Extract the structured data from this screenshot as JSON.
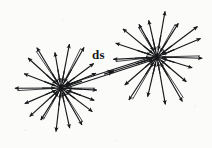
{
  "figure": {
    "title": "ds",
    "background_color": "#fbfbfa",
    "ink_color": "#17181a",
    "width": 212,
    "height": 148
  },
  "labels": [
    {
      "id": "ds",
      "text": "ds",
      "x": 92,
      "y": 48
    }
  ],
  "chart_data": {
    "type": "scatter",
    "title": "ds",
    "xlabel": "",
    "ylabel": "",
    "xlim": [
      0,
      212
    ],
    "ylim": [
      0,
      148
    ],
    "grid": false,
    "legend": "none",
    "annotations": [
      {
        "text": "ds",
        "x": 92,
        "y": 48
      }
    ],
    "sources": [
      {
        "name": "left-source",
        "cx": 61,
        "cy": 88,
        "ray_count": 18,
        "outward_length": 42,
        "inward_arrow_radius": 17,
        "rays_deg": [
          0,
          20,
          40,
          60,
          80,
          100,
          120,
          140,
          160,
          180,
          200,
          220,
          240,
          260,
          280,
          300,
          320,
          340
        ]
      },
      {
        "name": "right-source",
        "cx": 157,
        "cy": 57,
        "ray_count": 18,
        "outward_length": 46,
        "inward_arrow_radius": 18,
        "rays_deg": [
          0,
          20,
          40,
          60,
          80,
          100,
          120,
          140,
          160,
          180,
          200,
          220,
          240,
          260,
          280,
          300,
          320,
          340
        ]
      }
    ],
    "connector": {
      "name": "ds-vector",
      "from": [
        61,
        88
      ],
      "to": [
        157,
        57
      ],
      "style": "double-line",
      "mid_arrow_at": 0.55,
      "mid_arrow_direction": "toward-right-source"
    }
  }
}
